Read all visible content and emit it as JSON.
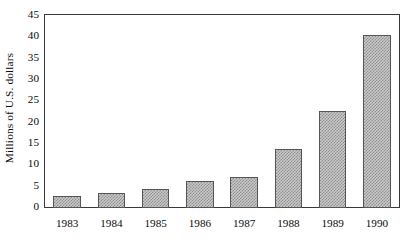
{
  "chart_data": {
    "type": "bar",
    "title": "",
    "subtitle": "",
    "xlabel": "",
    "ylabel": "Millions of U.S. dollars",
    "categories": [
      "1983",
      "1984",
      "1985",
      "1986",
      "1987",
      "1988",
      "1989",
      "1990"
    ],
    "values": [
      2.8,
      3.5,
      4.4,
      6.4,
      7.3,
      13.9,
      22.8,
      40.5
    ],
    "series": [
      {
        "name": "Millions of U.S. dollars",
        "values": [
          2.8,
          3.5,
          4.4,
          6.4,
          7.3,
          13.9,
          22.8,
          40.5
        ]
      }
    ],
    "ylim": [
      0,
      45
    ],
    "y_ticks": [
      0,
      5,
      10,
      15,
      20,
      25,
      30,
      35,
      40,
      45
    ],
    "y_tick_labels": [
      "0",
      "5",
      "10",
      "15",
      "20",
      "25",
      "30",
      "35",
      "40",
      "45"
    ],
    "x_tick_labels": [
      "1983",
      "1984",
      "1985",
      "1986",
      "1987",
      "1988",
      "1989",
      "1990"
    ],
    "grid": false,
    "legend": false,
    "legend_position": "none",
    "annotations": [],
    "colors": {
      "bar_fill": "#c9c9c9",
      "bar_hatch": "#8f8f8f",
      "bar_border": "#555555",
      "axis": "#3a3a3a",
      "text": "#0a0a0a",
      "background": "#ffffff"
    }
  }
}
